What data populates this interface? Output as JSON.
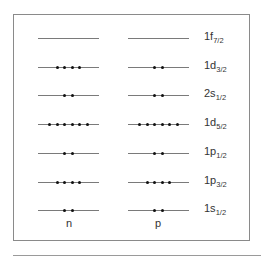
{
  "diagram": {
    "columns": [
      {
        "id": "n",
        "label": "n"
      },
      {
        "id": "p",
        "label": "p"
      }
    ],
    "levels": [
      {
        "orbital": "1f",
        "j": "7/2",
        "n_count": 0,
        "p_count": 0
      },
      {
        "orbital": "1d",
        "j": "3/2",
        "n_count": 4,
        "p_count": 2
      },
      {
        "orbital": "2s",
        "j": "1/2",
        "n_count": 2,
        "p_count": 2
      },
      {
        "orbital": "1d",
        "j": "5/2",
        "n_count": 6,
        "p_count": 6
      },
      {
        "orbital": "1p",
        "j": "1/2",
        "n_count": 2,
        "p_count": 2
      },
      {
        "orbital": "1p",
        "j": "3/2",
        "n_count": 4,
        "p_count": 4
      },
      {
        "orbital": "1s",
        "j": "1/2",
        "n_count": 2,
        "p_count": 2
      }
    ],
    "colors": {
      "line": "#7a7a7a",
      "dot": "#111111",
      "frame": "#8a8a8a"
    }
  }
}
